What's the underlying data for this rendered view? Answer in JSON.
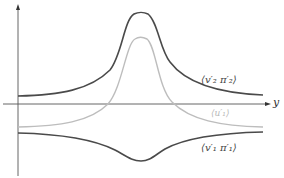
{
  "diagram": {
    "axis_x_label": "y",
    "curves": [
      {
        "id": "upper",
        "label": "⟨v′₂ π′₂⟩",
        "color": "#4a4a4a",
        "shape": "peak",
        "baseline": "above-axis"
      },
      {
        "id": "middle",
        "label": "⟨u′₁⟩",
        "color": "#bdbdbd",
        "shape": "peak",
        "baseline": "below-axis"
      },
      {
        "id": "lower",
        "label": "⟨v′₁ π′₁⟩",
        "color": "#4a4a4a",
        "shape": "trough",
        "baseline": "below-axis"
      }
    ],
    "colors": {
      "axis": "#555555",
      "dark_curve": "#4a4a4a",
      "light_curve": "#bdbdbd"
    }
  }
}
